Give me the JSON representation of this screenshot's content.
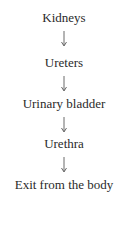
{
  "flowchart": {
    "nodes": [
      {
        "label": "Kidneys"
      },
      {
        "label": "Ureters"
      },
      {
        "label": "Urinary bladder"
      },
      {
        "label": "Urethra"
      },
      {
        "label": "Exit from the body"
      }
    ],
    "arrow_direction": "down",
    "text_color": "#2a2a2a",
    "background": "#ffffff"
  }
}
